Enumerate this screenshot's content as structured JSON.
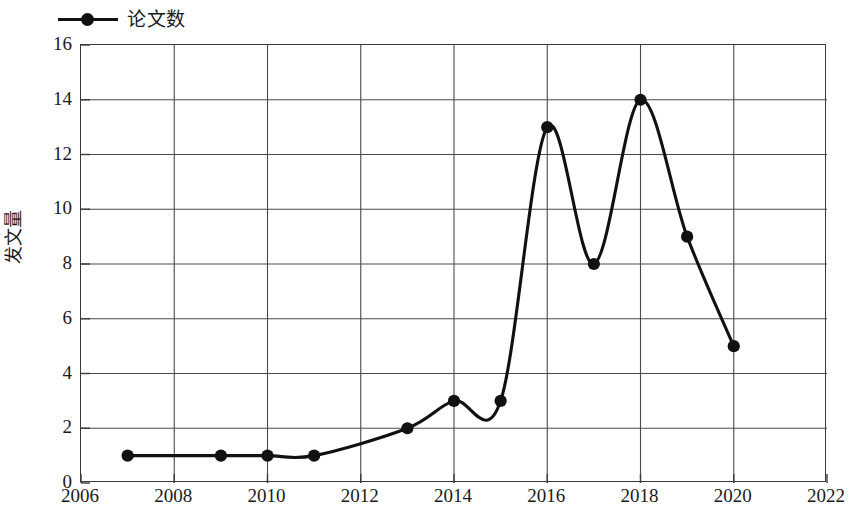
{
  "chart_data": {
    "type": "line",
    "title": "",
    "subtitle": "",
    "xlabel": "",
    "ylabel": "发文量",
    "legend": {
      "position": "top-left",
      "entries": [
        {
          "name": "论文数",
          "marker": "filled-circle",
          "color": "#111111"
        }
      ]
    },
    "grid": true,
    "xlim": [
      2006,
      2022
    ],
    "ylim": [
      0,
      16
    ],
    "xticks": [
      2006,
      2008,
      2010,
      2012,
      2014,
      2016,
      2018,
      2020,
      2022
    ],
    "yticks": [
      0,
      2,
      4,
      6,
      8,
      10,
      12,
      14,
      16
    ],
    "xtick_labels": [
      "2006",
      "2008",
      "2010",
      "2012",
      "2014",
      "2016",
      "2018",
      "2020",
      "2022"
    ],
    "ytick_labels": [
      "0",
      "2",
      "4",
      "6",
      "8",
      "10",
      "12",
      "14",
      "16"
    ],
    "interpolation": "smooth-spline",
    "series": [
      {
        "name": "论文数",
        "color": "#111111",
        "x": [
          2007,
          2009,
          2010,
          2011,
          2013,
          2014,
          2015,
          2016,
          2017,
          2018,
          2019,
          2020
        ],
        "values": [
          1,
          1,
          1,
          1,
          2,
          3,
          3,
          13,
          8,
          14,
          9,
          5
        ],
        "points": [
          {
            "x": 2007,
            "y": 1
          },
          {
            "x": 2009,
            "y": 1
          },
          {
            "x": 2010,
            "y": 1
          },
          {
            "x": 2011,
            "y": 1
          },
          {
            "x": 2013,
            "y": 2
          },
          {
            "x": 2014,
            "y": 3
          },
          {
            "x": 2015,
            "y": 3
          },
          {
            "x": 2016,
            "y": 13
          },
          {
            "x": 2017,
            "y": 8
          },
          {
            "x": 2018,
            "y": 14
          },
          {
            "x": 2019,
            "y": 9
          },
          {
            "x": 2020,
            "y": 5
          }
        ]
      }
    ]
  },
  "style": {
    "line_color": "#111111",
    "marker_color": "#111111",
    "grid_color": "#4a4a4a",
    "frame_color": "#3a3a3a",
    "background": "#ffffff"
  }
}
